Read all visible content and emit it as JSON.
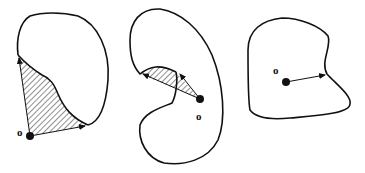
{
  "figure": {
    "panels": [
      {
        "id": "left",
        "origin_label": "o",
        "shading": "hatched region between two rays and curve"
      },
      {
        "id": "middle",
        "origin_label": "o",
        "shading": "hatched region between two rays"
      },
      {
        "id": "right",
        "origin_label": "o",
        "shading": "none, single ray to boundary"
      }
    ],
    "colors": {
      "stroke": "#111111",
      "background": "#ffffff"
    }
  }
}
